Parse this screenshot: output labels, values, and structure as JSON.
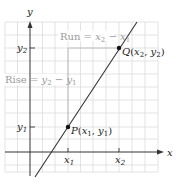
{
  "diagram": {
    "axes": {
      "x_label": "x",
      "y_label": "y",
      "x_ticks": [
        {
          "base": "x",
          "sub": "1"
        },
        {
          "base": "x",
          "sub": "2"
        }
      ],
      "y_ticks": [
        {
          "base": "y",
          "sub": "2"
        },
        {
          "base": "y",
          "sub": "1"
        }
      ]
    },
    "points": {
      "P": {
        "name": "P",
        "open": "(",
        "x": "x",
        "x_sub": "1",
        "sep": ", ",
        "y": "y",
        "y_sub": "1",
        "close": ")"
      },
      "Q": {
        "name": "Q",
        "open": "(",
        "x": "x",
        "x_sub": "2",
        "sep": ", ",
        "y": "y",
        "y_sub": "2",
        "close": ")"
      }
    },
    "annotations": {
      "run": {
        "word": "Run = ",
        "a": "x",
        "a_sub": "2",
        "minus": " − ",
        "b": "x",
        "b_sub": "1"
      },
      "rise": {
        "word": "Rise = ",
        "a": "y",
        "a_sub": "2",
        "minus": " − ",
        "b": "y",
        "b_sub": "1"
      }
    },
    "colors": {
      "grid": "#d9d9d9",
      "axis": "#333333",
      "line": "#333333",
      "guide": "#888888",
      "annotation_text": "#9a9a9a"
    }
  }
}
